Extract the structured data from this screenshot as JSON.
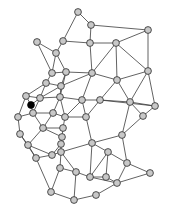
{
  "diagram": {
    "type": "node-link-graph",
    "width": 170,
    "height": 212,
    "background_color": "#ffffff",
    "node_fill_color": "#c8c8c8",
    "node_stroke_color": "#2a2a2a",
    "node_radius": 3.4,
    "highlight_fill_color": "#000000",
    "edge_color": "#3b3b3b",
    "edge_width": 0.8,
    "node_count": 48,
    "edge_count": 101,
    "highlighted_node_id": 21
  },
  "nodes": [
    {
      "id": 0,
      "x": 78,
      "y": 12,
      "state": "normal"
    },
    {
      "id": 1,
      "x": 91,
      "y": 25,
      "state": "normal"
    },
    {
      "id": 2,
      "x": 148,
      "y": 30,
      "state": "normal"
    },
    {
      "id": 3,
      "x": 37,
      "y": 42,
      "state": "normal"
    },
    {
      "id": 4,
      "x": 63,
      "y": 41,
      "state": "normal"
    },
    {
      "id": 5,
      "x": 90,
      "y": 43,
      "state": "normal"
    },
    {
      "id": 6,
      "x": 116,
      "y": 43,
      "state": "normal"
    },
    {
      "id": 7,
      "x": 56,
      "y": 53,
      "state": "normal"
    },
    {
      "id": 8,
      "x": 52,
      "y": 73,
      "state": "normal"
    },
    {
      "id": 9,
      "x": 66,
      "y": 72,
      "state": "normal"
    },
    {
      "id": 10,
      "x": 92,
      "y": 73,
      "state": "normal"
    },
    {
      "id": 11,
      "x": 117,
      "y": 80,
      "state": "normal"
    },
    {
      "id": 12,
      "x": 148,
      "y": 71,
      "state": "normal"
    },
    {
      "id": 13,
      "x": 46,
      "y": 83,
      "state": "normal"
    },
    {
      "id": 14,
      "x": 61,
      "y": 86,
      "state": "normal"
    },
    {
      "id": 15,
      "x": 26,
      "y": 96,
      "state": "normal"
    },
    {
      "id": 16,
      "x": 40,
      "y": 98,
      "state": "normal"
    },
    {
      "id": 17,
      "x": 60,
      "y": 97,
      "state": "normal"
    },
    {
      "id": 18,
      "x": 82,
      "y": 100,
      "state": "normal"
    },
    {
      "id": 19,
      "x": 100,
      "y": 100,
      "state": "normal"
    },
    {
      "id": 20,
      "x": 130,
      "y": 102,
      "state": "normal"
    },
    {
      "id": 21,
      "x": 31,
      "y": 105,
      "state": "highlighted"
    },
    {
      "id": 22,
      "x": 155,
      "y": 106,
      "state": "normal"
    },
    {
      "id": 23,
      "x": 18,
      "y": 117,
      "state": "normal"
    },
    {
      "id": 24,
      "x": 33,
      "y": 113,
      "state": "normal"
    },
    {
      "id": 25,
      "x": 53,
      "y": 113,
      "state": "normal"
    },
    {
      "id": 26,
      "x": 65,
      "y": 117,
      "state": "normal"
    },
    {
      "id": 27,
      "x": 86,
      "y": 117,
      "state": "normal"
    },
    {
      "id": 28,
      "x": 143,
      "y": 116,
      "state": "normal"
    },
    {
      "id": 29,
      "x": 43,
      "y": 128,
      "state": "normal"
    },
    {
      "id": 30,
      "x": 63,
      "y": 128,
      "state": "normal"
    },
    {
      "id": 31,
      "x": 20,
      "y": 134,
      "state": "normal"
    },
    {
      "id": 32,
      "x": 62,
      "y": 137,
      "state": "normal"
    },
    {
      "id": 33,
      "x": 92,
      "y": 143,
      "state": "normal"
    },
    {
      "id": 34,
      "x": 122,
      "y": 135,
      "state": "normal"
    },
    {
      "id": 35,
      "x": 28,
      "y": 145,
      "state": "normal"
    },
    {
      "id": 36,
      "x": 61,
      "y": 144,
      "state": "normal"
    },
    {
      "id": 37,
      "x": 36,
      "y": 158,
      "state": "normal"
    },
    {
      "id": 38,
      "x": 52,
      "y": 155,
      "state": "normal"
    },
    {
      "id": 39,
      "x": 61,
      "y": 152,
      "state": "normal"
    },
    {
      "id": 40,
      "x": 108,
      "y": 152,
      "state": "normal"
    },
    {
      "id": 41,
      "x": 60,
      "y": 168,
      "state": "normal"
    },
    {
      "id": 42,
      "x": 127,
      "y": 163,
      "state": "normal"
    },
    {
      "id": 43,
      "x": 76,
      "y": 172,
      "state": "normal"
    },
    {
      "id": 44,
      "x": 90,
      "y": 177,
      "state": "normal"
    },
    {
      "id": 45,
      "x": 106,
      "y": 177,
      "state": "normal"
    },
    {
      "id": 46,
      "x": 117,
      "y": 183,
      "state": "normal"
    },
    {
      "id": 47,
      "x": 150,
      "y": 173,
      "state": "normal"
    },
    {
      "id": 48,
      "x": 51,
      "y": 192,
      "state": "normal"
    },
    {
      "id": 49,
      "x": 74,
      "y": 200,
      "state": "normal"
    },
    {
      "id": 50,
      "x": 96,
      "y": 195,
      "state": "normal"
    }
  ],
  "edges": [
    [
      0,
      1
    ],
    [
      0,
      4
    ],
    [
      1,
      5
    ],
    [
      1,
      2
    ],
    [
      2,
      6
    ],
    [
      2,
      12
    ],
    [
      3,
      7
    ],
    [
      3,
      8
    ],
    [
      4,
      7
    ],
    [
      4,
      5
    ],
    [
      5,
      6
    ],
    [
      5,
      10
    ],
    [
      6,
      10
    ],
    [
      6,
      12
    ],
    [
      6,
      11
    ],
    [
      7,
      9
    ],
    [
      7,
      8
    ],
    [
      8,
      9
    ],
    [
      8,
      13
    ],
    [
      9,
      14
    ],
    [
      9,
      10
    ],
    [
      9,
      17
    ],
    [
      10,
      11
    ],
    [
      10,
      18
    ],
    [
      10,
      14
    ],
    [
      11,
      12
    ],
    [
      11,
      19
    ],
    [
      11,
      20
    ],
    [
      12,
      20
    ],
    [
      12,
      22
    ],
    [
      13,
      14
    ],
    [
      13,
      15
    ],
    [
      13,
      16
    ],
    [
      14,
      17
    ],
    [
      14,
      16
    ],
    [
      15,
      16
    ],
    [
      15,
      21
    ],
    [
      15,
      23
    ],
    [
      16,
      21
    ],
    [
      16,
      24
    ],
    [
      16,
      17
    ],
    [
      17,
      18
    ],
    [
      17,
      25
    ],
    [
      17,
      26
    ],
    [
      18,
      19
    ],
    [
      18,
      27
    ],
    [
      18,
      26
    ],
    [
      19,
      20
    ],
    [
      19,
      27
    ],
    [
      19,
      22
    ],
    [
      20,
      22
    ],
    [
      20,
      28
    ],
    [
      20,
      34
    ],
    [
      21,
      24
    ],
    [
      22,
      28
    ],
    [
      23,
      24
    ],
    [
      23,
      31
    ],
    [
      24,
      25
    ],
    [
      24,
      29
    ],
    [
      25,
      26
    ],
    [
      25,
      29
    ],
    [
      26,
      30
    ],
    [
      26,
      27
    ],
    [
      27,
      33
    ],
    [
      28,
      34
    ],
    [
      29,
      30
    ],
    [
      29,
      35
    ],
    [
      29,
      32
    ],
    [
      30,
      32
    ],
    [
      31,
      35
    ],
    [
      31,
      37
    ],
    [
      32,
      36
    ],
    [
      33,
      34
    ],
    [
      33,
      39
    ],
    [
      33,
      40
    ],
    [
      33,
      44
    ],
    [
      34,
      42
    ],
    [
      35,
      37
    ],
    [
      35,
      38
    ],
    [
      36,
      39
    ],
    [
      36,
      38
    ],
    [
      37,
      38
    ],
    [
      37,
      48
    ],
    [
      38,
      39
    ],
    [
      39,
      41
    ],
    [
      39,
      43
    ],
    [
      40,
      42
    ],
    [
      40,
      44
    ],
    [
      40,
      45
    ],
    [
      41,
      43
    ],
    [
      41,
      48
    ],
    [
      42,
      46
    ],
    [
      42,
      47
    ],
    [
      43,
      44
    ],
    [
      43,
      49
    ],
    [
      44,
      45
    ],
    [
      44,
      46
    ],
    [
      45,
      46
    ],
    [
      46,
      47
    ],
    [
      48,
      49
    ],
    [
      49,
      50
    ],
    [
      50,
      46
    ]
  ]
}
